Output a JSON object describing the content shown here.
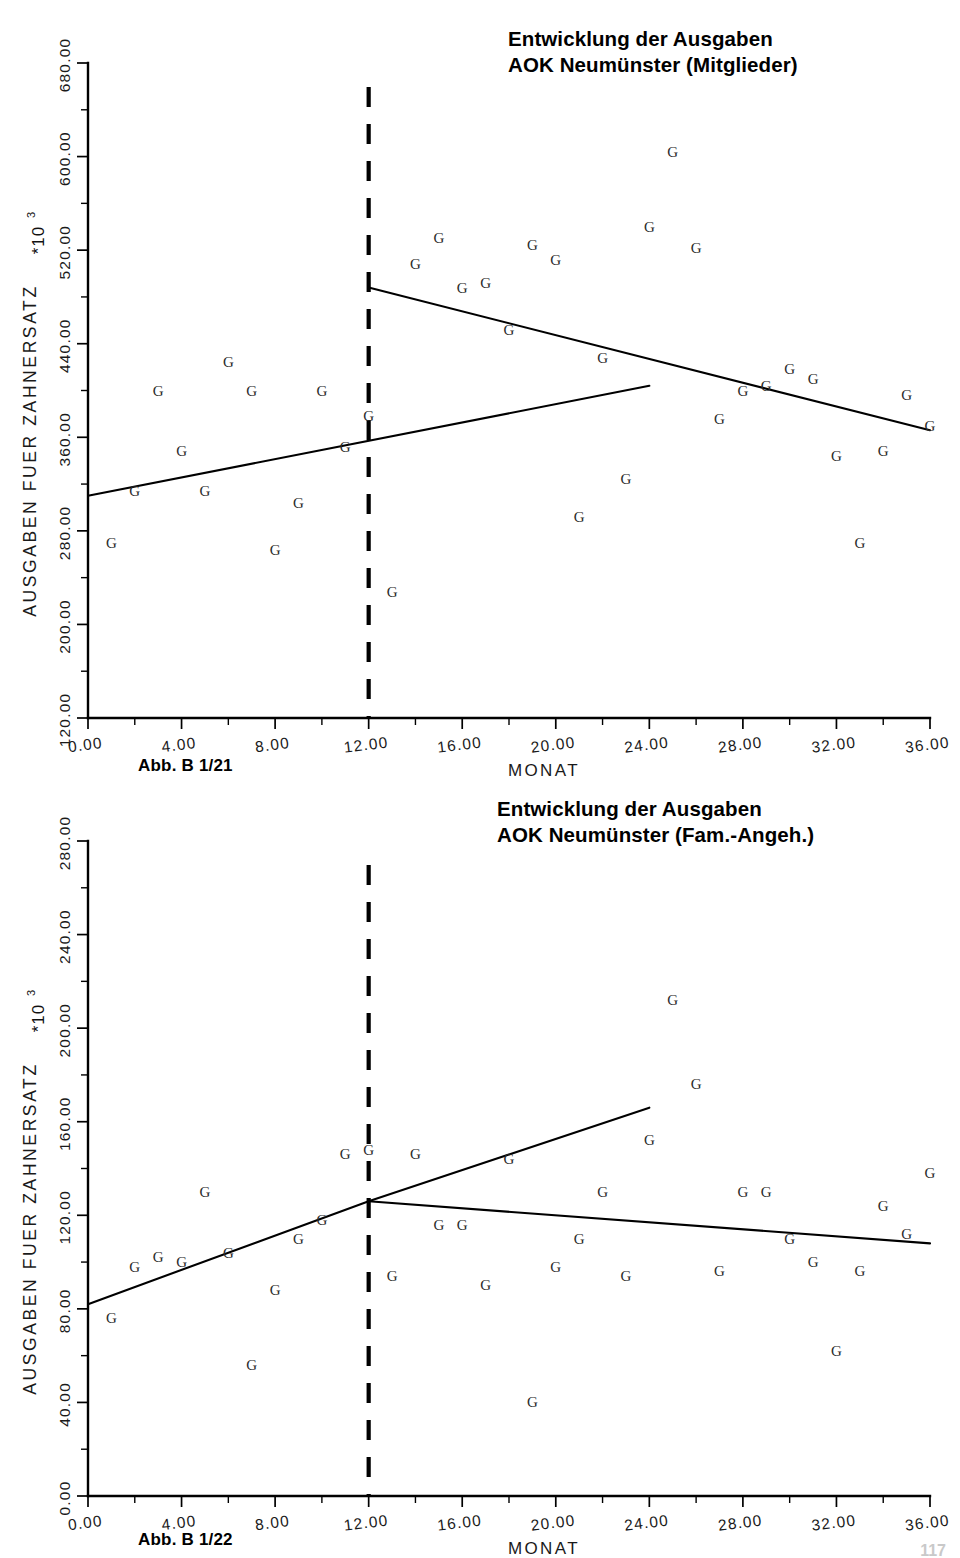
{
  "page": {
    "background": "#ffffff",
    "ink_color": "#000000",
    "page_number": "117"
  },
  "figures": [
    {
      "id": "figure-1",
      "title_line1": "Entwicklung der Ausgaben",
      "title_line2": "AOK Neumünster (Mitglieder)",
      "caption": "Abb. B 1/21",
      "scale_note": "*10",
      "scale_exponent": "3",
      "chart_data": {
        "type": "scatter",
        "title": "Entwicklung der Ausgaben AOK Neumünster (Mitglieder)",
        "xlabel": "MONAT",
        "ylabel": "AUSGABEN FUER ZAHNERSATZ",
        "y_scale_factor": "*10^3",
        "xlim": [
          0,
          36
        ],
        "ylim": [
          120,
          680
        ],
        "xticks": [
          "0.00",
          "4.00",
          "8.00",
          "12.00",
          "16.00",
          "20.00",
          "24.00",
          "28.00",
          "32.00",
          "36.00"
        ],
        "xtick_values": [
          0,
          4,
          8,
          12,
          16,
          20,
          24,
          28,
          32,
          36
        ],
        "yticks": [
          "120.00",
          "200.00",
          "280.00",
          "360.00",
          "440.00",
          "520.00",
          "600.00",
          "680.00"
        ],
        "ytick_values": [
          120,
          200,
          280,
          360,
          440,
          520,
          600,
          680
        ],
        "grid": false,
        "legend": "none",
        "marker_glyph": "G",
        "series": [
          {
            "name": "Ausgaben fuer Zahnersatz (Mitglieder)",
            "x": [
              1,
              2,
              3,
              4,
              5,
              6,
              7,
              8,
              9,
              10,
              11,
              12,
              13,
              14,
              15,
              16,
              17,
              18,
              19,
              20,
              21,
              22,
              23,
              24,
              25,
              26,
              27,
              28,
              29,
              30,
              31,
              32,
              33,
              34,
              35,
              36
            ],
            "y": [
              270,
              314,
              400,
              348,
              314,
              424,
              400,
              264,
              304,
              400,
              352,
              378,
              228,
              508,
              530,
              488,
              492,
              452,
              524,
              512,
              292,
              428,
              324,
              540,
              604,
              522,
              376,
              400,
              404,
              418,
              410,
              344,
              270,
              348,
              396,
              370
            ]
          }
        ],
        "annotations": [
          {
            "type": "vertical-dashed-line",
            "name": "intervention-line",
            "x": 12,
            "label": "intervention"
          },
          {
            "type": "regression-segment",
            "name": "pre-trend-line",
            "x_start": 0,
            "x_end": 24,
            "y_start": 310,
            "y_end": 404
          },
          {
            "type": "regression-segment",
            "name": "post-trend-line",
            "x_start": 12,
            "x_end": 36,
            "y_start": 488,
            "y_end": 366
          }
        ]
      }
    },
    {
      "id": "figure-2",
      "title_line1": "Entwicklung der Ausgaben",
      "title_line2": "AOK Neumünster (Fam.-Angeh.)",
      "caption": "Abb. B 1/22",
      "scale_note": "*10",
      "scale_exponent": "3",
      "chart_data": {
        "type": "scatter",
        "title": "Entwicklung der Ausgaben AOK Neumünster (Fam.-Angeh.)",
        "xlabel": "MONAT",
        "ylabel": "AUSGABEN FUER ZAHNERSATZ",
        "y_scale_factor": "*10^3",
        "xlim": [
          0,
          36
        ],
        "ylim": [
          0,
          280
        ],
        "xticks": [
          "0.00",
          "4.00",
          "8.00",
          "12.00",
          "16.00",
          "20.00",
          "24.00",
          "28.00",
          "32.00",
          "36.00"
        ],
        "xtick_values": [
          0,
          4,
          8,
          12,
          16,
          20,
          24,
          28,
          32,
          36
        ],
        "yticks": [
          "0.00",
          "40.00",
          "80.00",
          "120.00",
          "160.00",
          "200.00",
          "240.00",
          "280.00"
        ],
        "ytick_values": [
          0,
          40,
          80,
          120,
          160,
          200,
          240,
          280
        ],
        "grid": false,
        "legend": "none",
        "marker_glyph": "G",
        "series": [
          {
            "name": "Ausgaben fuer Zahnersatz (Fam.-Angeh.)",
            "x": [
              1,
              2,
              3,
              4,
              5,
              6,
              7,
              8,
              9,
              10,
              11,
              12,
              13,
              14,
              15,
              16,
              17,
              18,
              19,
              20,
              21,
              22,
              23,
              24,
              25,
              26,
              27,
              28,
              29,
              30,
              31,
              32,
              33,
              34,
              35,
              36
            ],
            "y": [
              76,
              98,
              102,
              100,
              130,
              104,
              56,
              88,
              110,
              118,
              146,
              148,
              94,
              146,
              116,
              116,
              90,
              144,
              40,
              98,
              110,
              130,
              94,
              152,
              212,
              176,
              96,
              130,
              130,
              110,
              100,
              62,
              96,
              124,
              112,
              138
            ]
          }
        ],
        "annotations": [
          {
            "type": "vertical-dashed-line",
            "name": "intervention-line",
            "x": 12,
            "label": "intervention"
          },
          {
            "type": "regression-segment",
            "name": "pre-trend-line",
            "x_start": 0,
            "x_end": 12,
            "y_start": 82,
            "y_end": 126
          },
          {
            "type": "regression-segment",
            "name": "post-trend-rising-line",
            "x_start": 12,
            "x_end": 24,
            "y_start": 126,
            "y_end": 166
          },
          {
            "type": "regression-segment",
            "name": "post-trend-declining-line",
            "x_start": 12,
            "x_end": 36,
            "y_start": 126,
            "y_end": 108
          }
        ]
      }
    }
  ]
}
